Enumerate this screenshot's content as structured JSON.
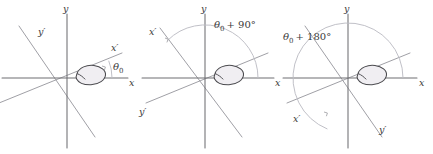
{
  "figure": {
    "type": "diagram",
    "width": 433,
    "height": 154,
    "background_color": "#ffffff",
    "axis_color": "#6e6e72",
    "prime_axis_color": "#a0a0a6",
    "arc_color": "#bdbdc4",
    "blob_outline_color": "#4a4a4e",
    "blob_fill_color": "#f0eef2",
    "text_color": "#3a3a3a"
  },
  "panels": [
    {
      "id": "panel-1",
      "origin": {
        "x": 67,
        "y": 78
      },
      "rotation_deg": 22,
      "labels": {
        "x_axis": "x",
        "y_axis": "y",
        "x_prime_axis": "x′",
        "y_prime_axis": "y′"
      },
      "angle_label": {
        "symbol": "θ",
        "subscript": "0",
        "suffix": "",
        "full": "θ₀"
      },
      "has_arc": true,
      "arc_span_deg": 22
    },
    {
      "id": "panel-2",
      "origin": {
        "x": 205,
        "y": 78
      },
      "rotation_deg": 22,
      "labels": {
        "x_axis": "x",
        "y_axis": "y",
        "x_prime_axis": "x′",
        "y_prime_axis": "y′"
      },
      "angle_label": {
        "symbol": "θ",
        "subscript": "0",
        "suffix": "+ 90°",
        "full": "θ₀ + 90°"
      },
      "has_arc": true,
      "arc_span_deg": 112
    },
    {
      "id": "panel-3",
      "origin": {
        "x": 348,
        "y": 78
      },
      "rotation_deg": 22,
      "labels": {
        "x_axis": "x",
        "y_axis": "y",
        "x_prime_axis": "x′",
        "y_prime_axis": "y′"
      },
      "angle_label": {
        "symbol": "θ",
        "subscript": "0",
        "suffix": "+ 180°",
        "full": "θ₀ + 180°"
      },
      "has_arc": true,
      "arc_span_deg": 202
    }
  ]
}
